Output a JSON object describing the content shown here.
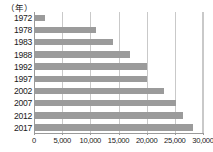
{
  "chart_data": {
    "type": "bar",
    "orientation": "horizontal",
    "title": "",
    "subtitle": "",
    "unit_caption": "（年）",
    "xlabel": "",
    "ylabel": "",
    "categories": [
      "1972",
      "1978",
      "1983",
      "1988",
      "1992",
      "1997",
      "2002",
      "2007",
      "2012",
      "2017"
    ],
    "values": [
      2000,
      11000,
      14000,
      17000,
      20000,
      20000,
      23000,
      25200,
      26500,
      28200
    ],
    "xlim": [
      0,
      30000
    ],
    "xticks": [
      0,
      5000,
      10000,
      15000,
      20000,
      25000,
      30000
    ],
    "xtick_labels": [
      "0",
      "5,000",
      "10,000",
      "15,000",
      "20,000",
      "25,000",
      "30,000"
    ],
    "grid": true,
    "grid_axis": "x",
    "legend": false,
    "bar_color": "#9b9b9b",
    "grid_color": "#c9c9c9",
    "axis_color": "#9a9a9a",
    "background_color": "#ffffff"
  }
}
